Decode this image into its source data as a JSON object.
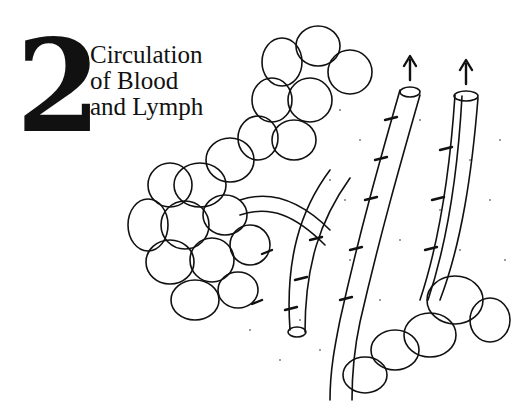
{
  "chapter": {
    "number": "2",
    "title_lines": [
      "Circulation",
      "of Blood",
      "and Lymph"
    ]
  },
  "illustration": {
    "subject": "blood and lymph vessels among tissue cells with flow arrows",
    "colors": {
      "ink": "#111111",
      "paper": "#ffffff"
    }
  }
}
